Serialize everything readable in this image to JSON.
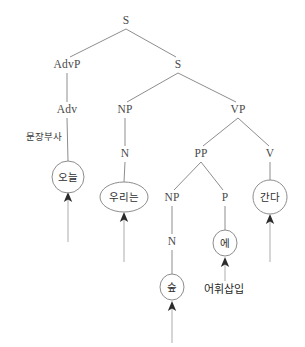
{
  "diagram": {
    "type": "syntax-tree",
    "title": "",
    "background_color": "#ffffff",
    "edge_color": "#8d8d8d",
    "arrow_color": "#b5b5b5",
    "text_color": "#4a4a4a"
  },
  "nodes": {
    "s_root": {
      "label": "S",
      "x": 126,
      "y": 21
    },
    "advp": {
      "label": "AdvP",
      "x": 67,
      "y": 65
    },
    "s_embedded": {
      "label": "S",
      "x": 178,
      "y": 65
    },
    "adv": {
      "label": "Adv",
      "x": 67,
      "y": 110
    },
    "np_subject": {
      "label": "NP",
      "x": 125,
      "y": 110
    },
    "vp": {
      "label": "VP",
      "x": 238,
      "y": 110
    },
    "n_subject": {
      "label": "N",
      "x": 125,
      "y": 154
    },
    "pp": {
      "label": "PP",
      "x": 201,
      "y": 154
    },
    "v": {
      "label": "V",
      "x": 270,
      "y": 154
    },
    "np_object": {
      "label": "NP",
      "x": 172,
      "y": 198
    },
    "p": {
      "label": "P",
      "x": 225,
      "y": 198
    },
    "n_object": {
      "label": "N",
      "x": 172,
      "y": 242
    }
  },
  "words": {
    "oneul": {
      "label": "오늘",
      "x": 68,
      "y": 177,
      "rx": 16,
      "ry": 16
    },
    "urineun": {
      "label": "우리는",
      "x": 124,
      "y": 197,
      "rx": 24,
      "ry": 15
    },
    "e": {
      "label": "에",
      "x": 225,
      "y": 243,
      "rx": 12,
      "ry": 13
    },
    "sup": {
      "label": "숲",
      "x": 172,
      "y": 287,
      "rx": 12,
      "ry": 13
    },
    "ganda": {
      "label": "간다",
      "x": 270,
      "y": 197,
      "rx": 17,
      "ry": 17
    }
  },
  "annotations": {
    "sentence_adverb": {
      "label": "문장부사",
      "x": 44,
      "y": 137
    },
    "lexical_insertion": {
      "label": "어휘삽입",
      "x": 224,
      "y": 290
    }
  },
  "arrows": {
    "oneul_arrow": {
      "x": 68,
      "y_top": 194,
      "y_bottom": 242
    },
    "urineun_arrow": {
      "x": 124,
      "y_top": 214,
      "y_bottom": 262
    },
    "e_arrow": {
      "x": 225,
      "y_top": 259,
      "y_bottom": 280
    },
    "sup_arrow": {
      "x": 172,
      "y_top": 303,
      "y_bottom": 342
    },
    "ganda_arrow": {
      "x": 270,
      "y_top": 216,
      "y_bottom": 262
    }
  }
}
